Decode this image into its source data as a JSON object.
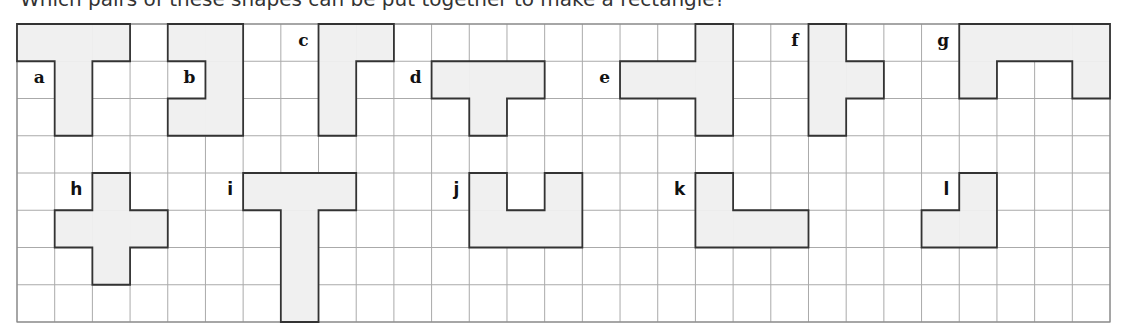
{
  "caption": "Which pairs of these shapes can be put together to make a rectangle?",
  "grid": {
    "left": 17,
    "top": 24,
    "cols": 29,
    "rows": 8,
    "cell_w": 37.69,
    "cell_h": 37.25,
    "line_color": "#aaaaaa",
    "border_color": "#888888"
  },
  "style": {
    "fill": "#f0f0f0",
    "stroke": "#333333"
  },
  "shapes": [
    {
      "label": "a",
      "font": "serif",
      "label_cell": [
        0,
        1
      ],
      "cells": [
        [
          0,
          0
        ],
        [
          1,
          0
        ],
        [
          2,
          0
        ],
        [
          1,
          1
        ],
        [
          1,
          2
        ]
      ]
    },
    {
      "label": "b",
      "font": "serif",
      "label_cell": [
        4,
        1
      ],
      "cells": [
        [
          4,
          0
        ],
        [
          5,
          0
        ],
        [
          5,
          1
        ],
        [
          4,
          2
        ],
        [
          5,
          2
        ]
      ]
    },
    {
      "label": "c",
      "font": "serif",
      "label_cell": [
        7,
        0
      ],
      "cells": [
        [
          8,
          0
        ],
        [
          9,
          0
        ],
        [
          8,
          1
        ],
        [
          8,
          2
        ]
      ]
    },
    {
      "label": "d",
      "font": "serif",
      "label_cell": [
        10,
        1
      ],
      "cells": [
        [
          11,
          1
        ],
        [
          12,
          1
        ],
        [
          13,
          1
        ],
        [
          12,
          2
        ]
      ]
    },
    {
      "label": "e",
      "font": "serif",
      "label_cell": [
        15,
        1
      ],
      "cells": [
        [
          18,
          0
        ],
        [
          16,
          1
        ],
        [
          17,
          1
        ],
        [
          18,
          1
        ],
        [
          18,
          2
        ]
      ]
    },
    {
      "label": "f",
      "font": "serif",
      "label_cell": [
        20,
        0
      ],
      "cells": [
        [
          21,
          0
        ],
        [
          21,
          1
        ],
        [
          22,
          1
        ],
        [
          21,
          2
        ]
      ]
    },
    {
      "label": "g",
      "font": "serif",
      "label_cell": [
        24,
        0
      ],
      "cells": [
        [
          25,
          0
        ],
        [
          26,
          0
        ],
        [
          27,
          0
        ],
        [
          28,
          0
        ],
        [
          25,
          1
        ],
        [
          28,
          1
        ]
      ]
    },
    {
      "label": "h",
      "font": "sans",
      "label_cell": [
        1,
        4
      ],
      "cells": [
        [
          2,
          4
        ],
        [
          1,
          5
        ],
        [
          2,
          5
        ],
        [
          3,
          5
        ],
        [
          2,
          6
        ]
      ]
    },
    {
      "label": "i",
      "font": "sans",
      "label_cell": [
        5,
        4
      ],
      "cells": [
        [
          6,
          4
        ],
        [
          7,
          4
        ],
        [
          8,
          4
        ],
        [
          7,
          5
        ],
        [
          7,
          6
        ],
        [
          7,
          7
        ]
      ]
    },
    {
      "label": "j",
      "font": "sans",
      "label_cell": [
        11,
        4
      ],
      "cells": [
        [
          12,
          4
        ],
        [
          14,
          4
        ],
        [
          12,
          5
        ],
        [
          13,
          5
        ],
        [
          14,
          5
        ]
      ]
    },
    {
      "label": "k",
      "font": "sans",
      "label_cell": [
        17,
        4
      ],
      "cells": [
        [
          18,
          4
        ],
        [
          18,
          5
        ],
        [
          19,
          5
        ],
        [
          20,
          5
        ]
      ]
    },
    {
      "label": "l",
      "font": "sans",
      "label_cell": [
        24,
        4
      ],
      "cells": [
        [
          25,
          4
        ],
        [
          24,
          5
        ],
        [
          25,
          5
        ]
      ]
    }
  ]
}
